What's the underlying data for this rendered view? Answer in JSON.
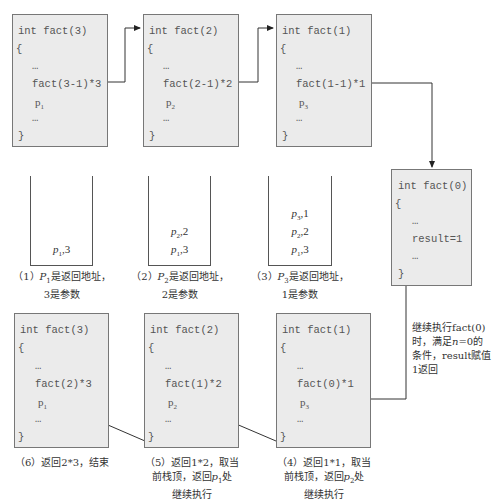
{
  "top_frames": [
    {
      "header": "int fact(3)",
      "open": "{",
      "dots1": "…",
      "call": "fact(3-1)*3",
      "ret": "p",
      "ret_sub": "1",
      "dots2": "…",
      "close": "}"
    },
    {
      "header": "int fact(2)",
      "open": "{",
      "dots1": "…",
      "call": "fact(2-1)*2",
      "ret": "p",
      "ret_sub": "2",
      "dots2": "…",
      "close": "}"
    },
    {
      "header": "int fact(1)",
      "open": "{",
      "dots1": "…",
      "call": "fact(1-1)*1",
      "ret": "p",
      "ret_sub": "3",
      "dots2": "…",
      "close": "}"
    }
  ],
  "base_frame": {
    "header": "int fact(0)",
    "open": "{",
    "dots1": "…",
    "stmt": "result=1",
    "dots2": "…",
    "close": "}"
  },
  "stacks": [
    {
      "items": [
        {
          "p": "p",
          "sub": "1",
          "val": ",3"
        }
      ],
      "caption_l1a": "（1）",
      "caption_p": "P",
      "caption_sub": "1",
      "caption_l1b": "是返回地址，",
      "caption_l2": "3是参数"
    },
    {
      "items": [
        {
          "p": "p",
          "sub": "2",
          "val": ",2"
        },
        {
          "p": "p",
          "sub": "1",
          "val": ",3"
        }
      ],
      "caption_l1a": "（2）",
      "caption_p": "P",
      "caption_sub": "2",
      "caption_l1b": "是返回地址，",
      "caption_l2": "2是参数"
    },
    {
      "items": [
        {
          "p": "p",
          "sub": "3",
          "val": ",1"
        },
        {
          "p": "p",
          "sub": "2",
          "val": ",2"
        },
        {
          "p": "p",
          "sub": "1",
          "val": ",3"
        }
      ],
      "caption_l1a": "（3）",
      "caption_p": "P",
      "caption_sub": "3",
      "caption_l1b": "是返回地址，",
      "caption_l2": "1是参数"
    }
  ],
  "bottom_frames": [
    {
      "header": "int fact(3)",
      "open": "{",
      "dots1": "…",
      "call": "fact(2)*3",
      "ret": "p",
      "ret_sub": "1",
      "dots2": "…",
      "close": "}"
    },
    {
      "header": "int fact(2)",
      "open": "{",
      "dots1": "…",
      "call": "fact(1)*2",
      "ret": "p",
      "ret_sub": "2",
      "dots2": "…",
      "close": "}"
    },
    {
      "header": "int fact(1)",
      "open": "{",
      "dots1": "…",
      "call": "fact(0)*1",
      "ret": "p",
      "ret_sub": "3",
      "dots2": "…",
      "close": "}"
    }
  ],
  "return_note": {
    "l1": "继续执行fact(0)",
    "l2a": "时，满足",
    "l2n": "n",
    "l2b": "=0的",
    "l3": "条件，result赋值",
    "l4": "1返回"
  },
  "captions_bottom": [
    {
      "l1": "（6）返回2*3，结束"
    },
    {
      "l1": "（5）返回1*2，取当",
      "l2a": "前栈顶，返回",
      "l2p": "p",
      "l2sub": "1",
      "l2b": "处",
      "l3": "继续执行"
    },
    {
      "l1": "（4）返回1*1，取当",
      "l2a": "前栈顶，返回",
      "l2p": "p",
      "l2sub": "2",
      "l2b": "处",
      "l3": "继续执行"
    }
  ]
}
